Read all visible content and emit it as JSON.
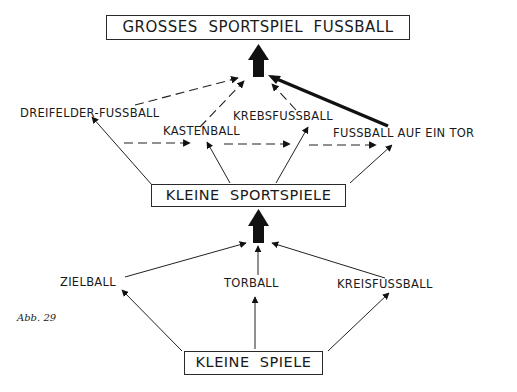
{
  "diagram": {
    "top_box": "GROSSES  SPORTSPIEL  FUSSBALL",
    "middle_box": "KLEINE  SPORTSPIELE",
    "bottom_box": "KLEINE  SPIELE",
    "upper_games": [
      "DREIFELDER-FUSSBALL",
      "KASTENBALL",
      "KREBSFUSSBALL",
      "FUSSBALL AUF EIN TOR"
    ],
    "lower_games": [
      "ZIELBALL",
      "TORBALL",
      "KREISFUSSBALL"
    ],
    "caption": "Abb. 29"
  }
}
